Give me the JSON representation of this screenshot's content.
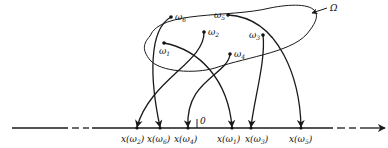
{
  "figure": {
    "set_label": "Ω",
    "origin_label": "0",
    "points": [
      {
        "id": "w1",
        "label": "ω",
        "sub": "1",
        "image_label": "x(ω",
        "image_sub": "1"
      },
      {
        "id": "w2",
        "label": "ω",
        "sub": "2",
        "image_label": "x(ω",
        "image_sub": "2"
      },
      {
        "id": "w3",
        "label": "ω",
        "sub": "3",
        "image_label": "x(ω",
        "image_sub": "3"
      },
      {
        "id": "w4",
        "label": "ω",
        "sub": "4",
        "image_label": "x(ω",
        "image_sub": "4"
      },
      {
        "id": "w5",
        "label": "ω",
        "sub": "5",
        "image_label": "x(ω",
        "image_sub": "5"
      },
      {
        "id": "w6",
        "label": "ω",
        "sub": "6",
        "image_label": "x(ω",
        "image_sub": "6"
      }
    ],
    "axis_order": [
      "x(ω2)",
      "x(ω6)",
      "x(ω4)",
      "x(ω1)",
      "x(ω3)",
      "x(ω5)"
    ]
  }
}
